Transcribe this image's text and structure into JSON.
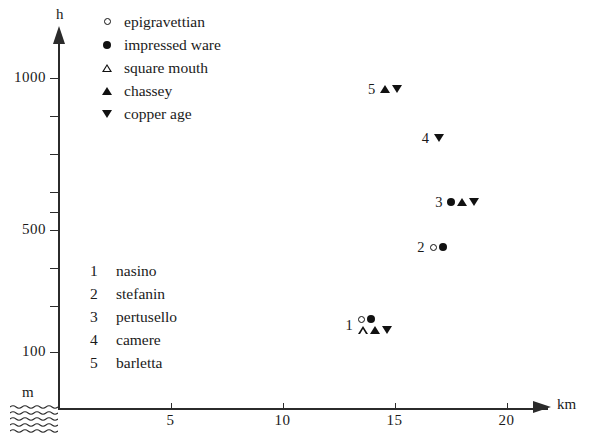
{
  "chart_data": {
    "type": "scatter",
    "title": "",
    "xlabel": "km",
    "ylabel": "h",
    "y_unit": "m",
    "xlim": [
      0,
      21.8
    ],
    "ylim": [
      0,
      1125
    ],
    "grid": false,
    "legend_position": "top-right",
    "x_ticks": [
      {
        "value": 5,
        "label": "5"
      },
      {
        "value": 10,
        "label": "10"
      },
      {
        "value": 15,
        "label": "15"
      },
      {
        "value": 20,
        "label": "20"
      }
    ],
    "y_ticks": [
      {
        "value": 1000,
        "label": "1000"
      },
      {
        "value": 875,
        "label": ""
      },
      {
        "value": 750,
        "label": ""
      },
      {
        "value": 625,
        "label": ""
      },
      {
        "value": 560,
        "label": ""
      },
      {
        "value": 500,
        "label": "500"
      },
      {
        "value": 375,
        "label": ""
      },
      {
        "value": 250,
        "label": ""
      },
      {
        "value": 100,
        "label": "100"
      }
    ],
    "legend": [
      {
        "marker": "circle-open",
        "label": "epigravettian"
      },
      {
        "marker": "circle-filled",
        "label": "impressed ware"
      },
      {
        "marker": "triangle-up-open",
        "label": "square mouth"
      },
      {
        "marker": "triangle-up-filled",
        "label": "chassey"
      },
      {
        "marker": "triangle-down-filled",
        "label": "copper age"
      }
    ],
    "site_key": [
      {
        "number": "1",
        "name": "nasino"
      },
      {
        "number": "2",
        "name": "stefanin"
      },
      {
        "number": "3",
        "name": "pertusello"
      },
      {
        "number": "4",
        "name": "camere"
      },
      {
        "number": "5",
        "name": "barletta"
      }
    ],
    "points": [
      {
        "number": "1",
        "name": "nasino",
        "x": 13.8,
        "y": 185,
        "markers": [
          "circle-open",
          "circle-filled",
          "triangle-up-open",
          "triangle-up-filled",
          "triangle-down-filled"
        ]
      },
      {
        "number": "2",
        "name": "stefanin",
        "x": 17.0,
        "y": 440,
        "markers": [
          "circle-open",
          "circle-filled"
        ]
      },
      {
        "number": "3",
        "name": "pertusello",
        "x": 17.8,
        "y": 590,
        "markers": [
          "circle-filled",
          "triangle-up-filled",
          "triangle-down-filled"
        ]
      },
      {
        "number": "4",
        "name": "camere",
        "x": 17.2,
        "y": 800,
        "markers": [
          "triangle-down-filled"
        ]
      },
      {
        "number": "5",
        "name": "barletta",
        "x": 14.8,
        "y": 960,
        "markers": [
          "triangle-up-filled",
          "triangle-down-filled"
        ]
      }
    ],
    "annotations": [
      {
        "name": "sea-level-hatch",
        "description": "wavy water hatching below axis origin"
      }
    ],
    "colors": {
      "axis": "#2b2b2b",
      "marker": "#111111",
      "background": "#ffffff"
    }
  }
}
